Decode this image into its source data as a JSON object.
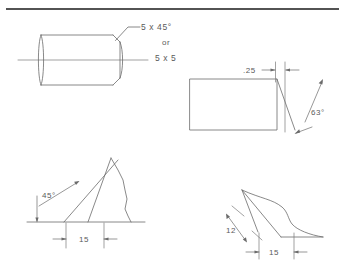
{
  "sheet": {
    "title": "chamfer-dimensioning-technical-drawing",
    "background": "#ffffff",
    "line_color": "#6b6b6b",
    "text_color": "#5a5a5a",
    "rule_color": "#1a1a1a",
    "width": 345,
    "height": 276
  },
  "top_rule": {
    "label": "horizontal-rule"
  },
  "figures": {
    "cylinder": {
      "name": "chamfered-cylinder-view",
      "leader_note_line1": "5 x 45°",
      "leader_note_line2": "or",
      "leader_note_line3": "5 x 5"
    },
    "rectangle": {
      "name": "rectangle-angled-cut-view",
      "dimension_label": ".25",
      "angle_label": "63°"
    },
    "triangle": {
      "name": "triangle-break-view",
      "angle_label": "45°",
      "dimension_label": "15"
    },
    "parallelogram": {
      "name": "parallelogram-break-view",
      "dimension_label_1": "12",
      "dimension_label_2": "15"
    }
  }
}
